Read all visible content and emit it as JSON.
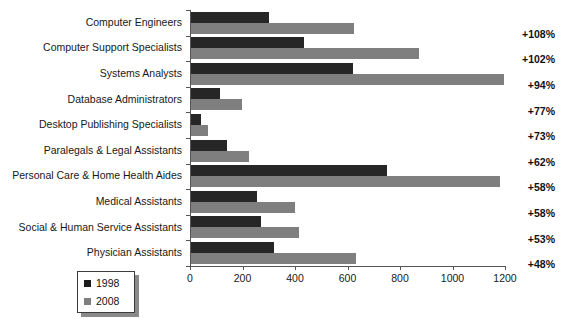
{
  "chart_data": {
    "type": "bar",
    "orientation": "horizontal",
    "title": "",
    "xlabel": "",
    "ylabel": "",
    "xlim": [
      0,
      1200
    ],
    "xticks": [
      0,
      200,
      400,
      600,
      800,
      1000,
      1200
    ],
    "xticklabels": [
      "0",
      "200",
      "400",
      "600",
      "800",
      "1000",
      "1200"
    ],
    "grid": false,
    "legend_position": "bottom-left",
    "categories": [
      "Computer Engineers",
      "Computer Support Specialists",
      "Systems Analysts",
      "Database Administrators",
      "Desktop Publishing Specialists",
      "Paralegals & Legal Assistants",
      "Personal Care & Home Health Aides",
      "Medical Assistants",
      "Social & Human Service Assistants",
      "Physician Assistants"
    ],
    "series": [
      {
        "name": "1998",
        "color": "#262626",
        "values": [
          299,
          429,
          617,
          110,
          38,
          136,
          746,
          252,
          268,
          317
        ]
      },
      {
        "name": "2008",
        "color": "#7f7f7f",
        "values": [
          622,
          869,
          1194,
          194,
          66,
          220,
          1179,
          398,
          410,
          628
        ]
      }
    ],
    "annotations": {
      "label": "percent growth 1998-2008",
      "values": [
        "+108%",
        "+102%",
        "+94%",
        "+77%",
        "+73%",
        "+62%",
        "+58%",
        "+58%",
        "+53%",
        "+48%"
      ]
    }
  },
  "legend": {
    "items": [
      {
        "label": "1998",
        "swatch": "dark-square-swatch"
      },
      {
        "label": "2008",
        "swatch": "gray-square-swatch"
      }
    ]
  }
}
